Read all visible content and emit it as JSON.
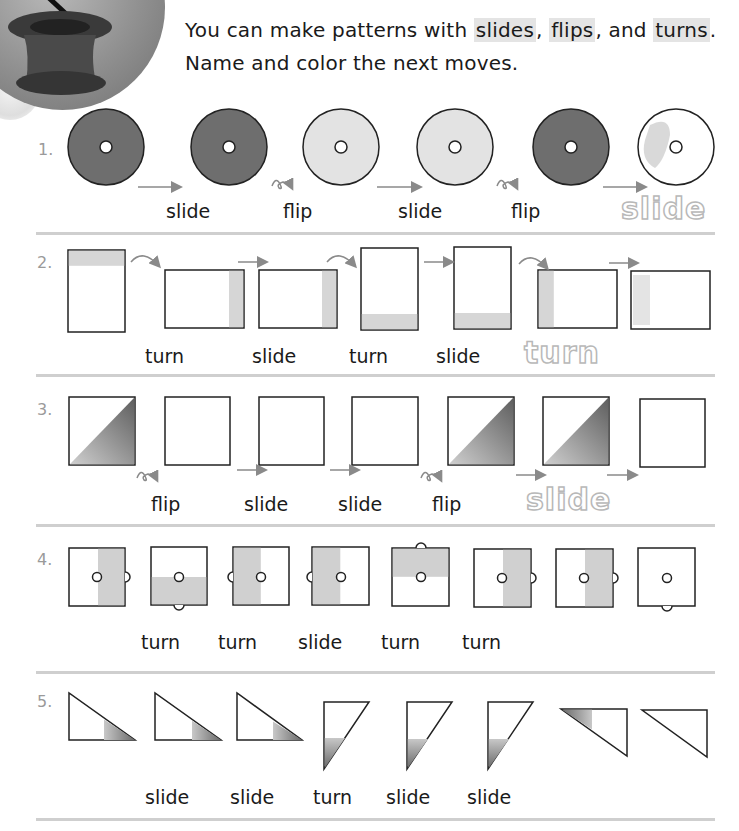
{
  "header": {
    "logo_icon": "magic-hat-badge",
    "instruction_line1_prefix": "You can make patterns with ",
    "keyword_slides": "slides",
    "comma1": ", ",
    "keyword_flips": "flips",
    "comma2": ", and ",
    "keyword_turns": "turns",
    "period": ".",
    "instruction_line2": "Name and color the next moves."
  },
  "colors": {
    "dark_fill": "#6e6e6e",
    "light_fill": "#d6d6d6",
    "mid_gray": "#c4c4c4",
    "separator": "#cfcfcf",
    "number_gray": "#9a9a9a",
    "trace_gray": "#b8b8b8"
  },
  "problems": [
    {
      "number": "1.",
      "shape": "ring",
      "labels": [
        "slide",
        "flip",
        "slide",
        "flip"
      ],
      "traced_answer": "slide"
    },
    {
      "number": "2.",
      "shape": "rectangle",
      "labels": [
        "turn",
        "slide",
        "turn",
        "slide"
      ],
      "traced_answer": "turn"
    },
    {
      "number": "3.",
      "shape": "square-diagonal",
      "labels": [
        "flip",
        "slide",
        "slide",
        "flip"
      ],
      "traced_answer": "slide"
    },
    {
      "number": "4.",
      "shape": "square-with-knobs",
      "labels": [
        "turn",
        "turn",
        "slide",
        "turn",
        "turn"
      ]
    },
    {
      "number": "5.",
      "shape": "right-triangle",
      "labels": [
        "slide",
        "slide",
        "turn",
        "slide",
        "slide"
      ]
    }
  ]
}
